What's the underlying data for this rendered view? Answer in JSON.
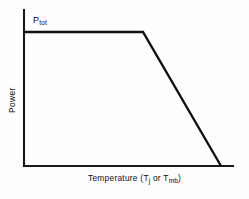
{
  "chart_data": {
    "type": "line",
    "title": "",
    "subtitle": "",
    "xlabel_parts": {
      "prefix": "Temperature  (T",
      "sub1": "j",
      "middle": " or T",
      "sub2": "mb",
      "suffix": ")"
    },
    "xlabel": "Temperature (Tj or Tmb)",
    "ylabel": "Power",
    "annotations": [
      {
        "name": "ptot-label",
        "text": "Ptot",
        "base": "P",
        "sub": "tot",
        "x_frac": 0.09,
        "y_frac": 0.88
      }
    ],
    "series": [
      {
        "name": "power-derating-curve",
        "x": [
          0,
          0.57,
          0.94
        ],
        "y": [
          1.0,
          1.0,
          0.0
        ],
        "comment": "Flat at Ptot until knee, then linear derating to zero"
      }
    ],
    "xlim": [
      0,
      1
    ],
    "ylim": [
      0,
      1.16
    ],
    "grid": false,
    "legend": false,
    "axis_ticks": false,
    "line_color": "#111111",
    "axis_color": "#1a1a1a",
    "background_color": "#fdfdfd"
  },
  "geometry": {
    "axis_origin_x": 24,
    "axis_origin_y": 166,
    "axis_top_y": 10,
    "axis_right_x": 233,
    "plateau_y": 32,
    "knee_x": 143,
    "zero_cross_x": 221
  }
}
